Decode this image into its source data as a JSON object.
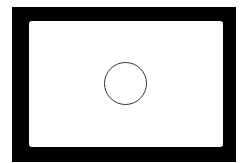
{
  "diagram": {
    "frame": {
      "color": "#000000"
    },
    "viewfinder": {
      "color": "#ffffff"
    },
    "focus_circle": {
      "stroke": "#333333"
    }
  }
}
